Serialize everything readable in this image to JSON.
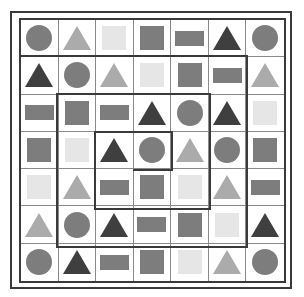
{
  "puzzle": {
    "rows": 7,
    "cols": 7,
    "colors": {
      "dark": "#3f3f3f",
      "mid": "#7d7d7d",
      "light": "#ababab",
      "vlight": "#e6e6e6",
      "line": "#3a3a3a"
    },
    "grid": [
      [
        {
          "shape": "circle",
          "tone": "mid"
        },
        {
          "shape": "triangle",
          "tone": "light"
        },
        {
          "shape": "square",
          "tone": "vlight"
        },
        {
          "shape": "square",
          "tone": "mid"
        },
        {
          "shape": "rect",
          "tone": "mid"
        },
        {
          "shape": "triangle",
          "tone": "dark"
        },
        {
          "shape": "circle",
          "tone": "mid"
        }
      ],
      [
        {
          "shape": "triangle",
          "tone": "dark"
        },
        {
          "shape": "circle",
          "tone": "mid"
        },
        {
          "shape": "triangle",
          "tone": "light"
        },
        {
          "shape": "square",
          "tone": "vlight"
        },
        {
          "shape": "square",
          "tone": "mid"
        },
        {
          "shape": "rect",
          "tone": "mid"
        },
        {
          "shape": "triangle",
          "tone": "light"
        }
      ],
      [
        {
          "shape": "rect",
          "tone": "mid"
        },
        {
          "shape": "square",
          "tone": "mid"
        },
        {
          "shape": "rect",
          "tone": "mid"
        },
        {
          "shape": "triangle",
          "tone": "dark"
        },
        {
          "shape": "circle",
          "tone": "mid"
        },
        {
          "shape": "triangle",
          "tone": "dark"
        },
        {
          "shape": "square",
          "tone": "vlight"
        }
      ],
      [
        {
          "shape": "square",
          "tone": "mid"
        },
        {
          "shape": "square",
          "tone": "vlight"
        },
        {
          "shape": "triangle",
          "tone": "dark"
        },
        {
          "shape": "circle",
          "tone": "mid"
        },
        {
          "shape": "triangle",
          "tone": "light"
        },
        {
          "shape": "circle",
          "tone": "mid"
        },
        {
          "shape": "square",
          "tone": "mid"
        }
      ],
      [
        {
          "shape": "square",
          "tone": "vlight"
        },
        {
          "shape": "triangle",
          "tone": "light"
        },
        {
          "shape": "rect",
          "tone": "mid"
        },
        {
          "shape": "square",
          "tone": "mid"
        },
        {
          "shape": "square",
          "tone": "vlight"
        },
        {
          "shape": "triangle",
          "tone": "light"
        },
        {
          "shape": "rect",
          "tone": "mid"
        }
      ],
      [
        {
          "shape": "triangle",
          "tone": "light"
        },
        {
          "shape": "circle",
          "tone": "mid"
        },
        {
          "shape": "triangle",
          "tone": "dark"
        },
        {
          "shape": "rect",
          "tone": "mid"
        },
        {
          "shape": "square",
          "tone": "mid"
        },
        {
          "shape": "square",
          "tone": "vlight"
        },
        {
          "shape": "triangle",
          "tone": "dark"
        }
      ],
      [
        {
          "shape": "circle",
          "tone": "mid"
        },
        {
          "shape": "triangle",
          "tone": "dark"
        },
        {
          "shape": "rect",
          "tone": "mid"
        },
        {
          "shape": "square",
          "tone": "mid"
        },
        {
          "shape": "square",
          "tone": "vlight"
        },
        {
          "shape": "triangle",
          "tone": "light"
        },
        {
          "shape": "circle",
          "tone": "mid"
        }
      ]
    ],
    "spiral_path": "M19,56 L247,56 L247,247 L57,247 L57,94 L210,94 L210,209 L95,209 L95,132 L172,132 L172,170 L133,170"
  }
}
